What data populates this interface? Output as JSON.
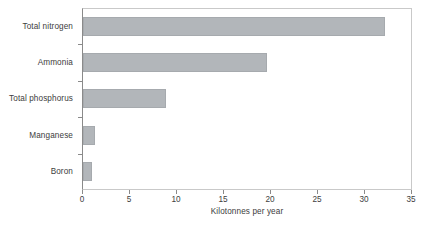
{
  "chart_data": {
    "type": "bar",
    "orientation": "horizontal",
    "title": "",
    "xlabel": "Kilotonnes per year",
    "ylabel": "",
    "categories": [
      "Boron",
      "Manganese",
      "Total phosphorus",
      "Ammonia",
      "Total nitrogen"
    ],
    "values": [
      1.0,
      1.3,
      8.8,
      19.6,
      32.1
    ],
    "series": [
      {
        "name": "Kilotonnes per year",
        "values": [
          1.0,
          1.3,
          8.8,
          19.6,
          32.1
        ]
      }
    ],
    "xlim": [
      0,
      35
    ],
    "xticks": [
      0,
      5,
      10,
      15,
      20,
      25,
      30,
      35
    ],
    "xtick_labels": [
      "0",
      "5",
      "10",
      "15",
      "20",
      "25",
      "30",
      "35"
    ],
    "grid": false,
    "legend": false,
    "bar_color": "#b2b6ba",
    "axis_color": "#8a8a8a",
    "frame_color": "#c9c9c9",
    "text_color": "#3d3d3d"
  }
}
